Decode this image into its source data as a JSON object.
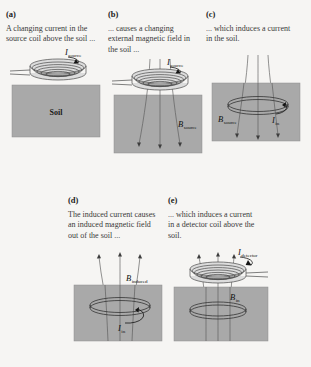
{
  "figure": {
    "background_color": "#f6f5f3",
    "soil_color": "#a9a9a9",
    "coil_color": "#4a4a4a",
    "field_line_color": "#5a5a5a"
  },
  "panels": [
    {
      "key": "a",
      "label": "(a)",
      "caption": "A changing current in the source coil above the soil ...",
      "soil_text": "Soil",
      "annotations": [
        {
          "symbol": "I",
          "subscript": "source",
          "name": "current-source-label"
        }
      ],
      "has_source_coil": true,
      "has_soil_ring": false,
      "has_detector_coil": false,
      "field_lines": "none"
    },
    {
      "key": "b",
      "label": "(b)",
      "caption": "... causes a changing external magnetic field in the soil ...",
      "soil_text": "",
      "annotations": [
        {
          "symbol": "I",
          "subscript": "source",
          "name": "current-source-label"
        },
        {
          "symbol": "B",
          "subscript": "source",
          "name": "field-source-label"
        }
      ],
      "has_source_coil": true,
      "has_soil_ring": false,
      "has_detector_coil": false,
      "field_lines": "down"
    },
    {
      "key": "c",
      "label": "(c)",
      "caption": "... which induces a current in the soil.",
      "soil_text": "",
      "annotations": [
        {
          "symbol": "B",
          "subscript": "source",
          "name": "field-source-label"
        },
        {
          "symbol": "I",
          "subscript": "in",
          "name": "current-induced-label"
        }
      ],
      "has_source_coil": false,
      "has_soil_ring": true,
      "has_detector_coil": false,
      "field_lines": "down"
    },
    {
      "key": "d",
      "label": "(d)",
      "caption": "The induced current causes an induced magnetic field out of the soil ...",
      "soil_text": "",
      "annotations": [
        {
          "symbol": "B",
          "subscript": "induced",
          "name": "field-induced-label"
        },
        {
          "symbol": "I",
          "subscript": "in",
          "name": "current-induced-label"
        }
      ],
      "has_source_coil": false,
      "has_soil_ring": true,
      "has_detector_coil": false,
      "field_lines": "up"
    },
    {
      "key": "e",
      "label": "(e)",
      "caption": "... which induces a current in a detector coil above the soil.",
      "soil_text": "",
      "annotations": [
        {
          "symbol": "I",
          "subscript": "detector",
          "name": "current-detector-label"
        },
        {
          "symbol": "B",
          "subscript": "in",
          "name": "field-induced-label"
        }
      ],
      "has_source_coil": false,
      "has_soil_ring": true,
      "has_detector_coil": true,
      "field_lines": "up"
    }
  ]
}
